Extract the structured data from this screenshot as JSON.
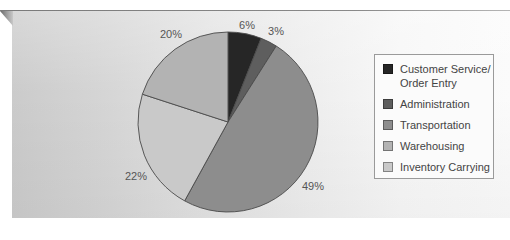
{
  "chart_data": {
    "type": "pie",
    "title": "",
    "direction": "clockwise",
    "start_angle_deg": 0,
    "categories": [
      "Customer Service/ Order Entry",
      "Administration",
      "Transportation",
      "Inventory Carrying",
      "Warehousing"
    ],
    "values": [
      6,
      3,
      49,
      22,
      20
    ],
    "labels": [
      "6%",
      "3%",
      "49%",
      "22%",
      "20%"
    ],
    "colors": [
      "#262626",
      "#5e5e5e",
      "#8d8d8d",
      "#c9c9c9",
      "#b3b3b3"
    ],
    "legend_position": "right",
    "unit": "%"
  },
  "legend": {
    "items": [
      {
        "line1": "Customer Service/",
        "line2": "Order Entry",
        "color": "#262626"
      },
      {
        "line1": "Administration",
        "line2": "",
        "color": "#5e5e5e"
      },
      {
        "line1": "Transportation",
        "line2": "",
        "color": "#8d8d8d"
      },
      {
        "line1": "Warehousing",
        "line2": "",
        "color": "#b3b3b3"
      },
      {
        "line1": "Inventory Carrying",
        "line2": "",
        "color": "#c9c9c9"
      }
    ]
  }
}
